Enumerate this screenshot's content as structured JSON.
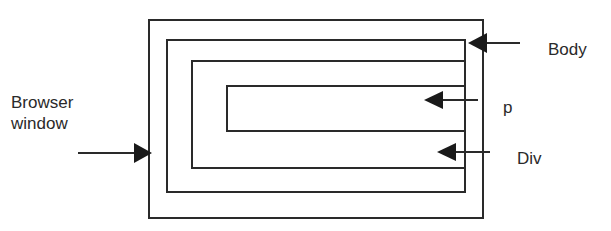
{
  "diagram": {
    "nodes": [
      {
        "id": "browser-window",
        "label": "Browser window",
        "box": {
          "x": 148,
          "y": 19,
          "w": 336,
          "h": 200
        }
      },
      {
        "id": "body",
        "label": "Body",
        "box": {
          "x": 166,
          "y": 39,
          "w": 300,
          "h": 154
        }
      },
      {
        "id": "div",
        "label": "Div",
        "box": {
          "x": 191,
          "y": 60,
          "w": 275,
          "h": 109
        }
      },
      {
        "id": "p",
        "label": "p",
        "box": {
          "x": 226,
          "y": 85,
          "w": 240,
          "h": 47
        }
      }
    ],
    "labels": {
      "browser_window_line1": "Browser",
      "browser_window_line2": "window",
      "body": "Body",
      "p": "p",
      "div": "Div"
    },
    "arrows": [
      {
        "from": "Browser window label",
        "to": "browser-window",
        "direction": "right"
      },
      {
        "from": "Body label",
        "to": "body",
        "direction": "left"
      },
      {
        "from": "p label",
        "to": "p",
        "direction": "left"
      },
      {
        "from": "Div label",
        "to": "div",
        "direction": "left"
      }
    ],
    "colors": {
      "stroke": "#2a2a2a",
      "background": "#ffffff"
    }
  }
}
